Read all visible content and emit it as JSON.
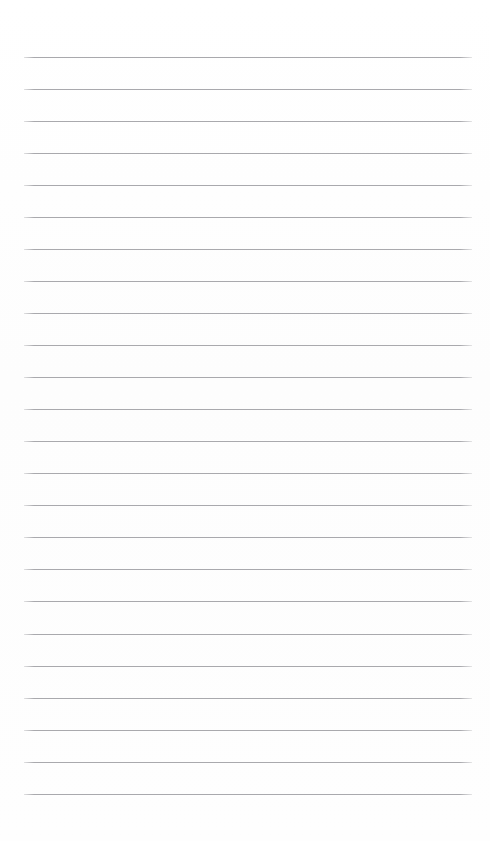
{
  "page": {
    "kind": "ruled-notepaper",
    "width": 490,
    "height": 841,
    "background_color": "#fefefe",
    "orientation": "portrait",
    "text_content": "",
    "is_blank": true
  },
  "ruling": {
    "line_count": 24,
    "line_color": "#a9a9ad",
    "line_thickness_px": 1,
    "line_spacing_px": 32,
    "first_line_y": 57,
    "last_line_y": 794,
    "line_start_x": 24,
    "line_end_x": 472,
    "line_width_px": 448,
    "left_margin_px": 24,
    "right_margin_px": 18,
    "top_margin_px": 57,
    "bottom_margin_px": 47,
    "has_vertical_margin_rule": false,
    "has_holes": false,
    "lines": [
      {
        "index": 1,
        "y": 57,
        "label": "rule-line-1"
      },
      {
        "index": 2,
        "y": 89,
        "label": "rule-line-2"
      },
      {
        "index": 3,
        "y": 121,
        "label": "rule-line-3"
      },
      {
        "index": 4,
        "y": 153,
        "label": "rule-line-4"
      },
      {
        "index": 5,
        "y": 185,
        "label": "rule-line-5"
      },
      {
        "index": 6,
        "y": 217,
        "label": "rule-line-6"
      },
      {
        "index": 7,
        "y": 249,
        "label": "rule-line-7"
      },
      {
        "index": 8,
        "y": 281,
        "label": "rule-line-8"
      },
      {
        "index": 9,
        "y": 313,
        "label": "rule-line-9"
      },
      {
        "index": 10,
        "y": 345,
        "label": "rule-line-10"
      },
      {
        "index": 11,
        "y": 377,
        "label": "rule-line-11"
      },
      {
        "index": 12,
        "y": 409,
        "label": "rule-line-12"
      },
      {
        "index": 13,
        "y": 441,
        "label": "rule-line-13"
      },
      {
        "index": 14,
        "y": 473,
        "label": "rule-line-14"
      },
      {
        "index": 15,
        "y": 505,
        "label": "rule-line-15"
      },
      {
        "index": 16,
        "y": 537,
        "label": "rule-line-16"
      },
      {
        "index": 17,
        "y": 569,
        "label": "rule-line-17"
      },
      {
        "index": 18,
        "y": 601,
        "label": "rule-line-18"
      },
      {
        "index": 19,
        "y": 634,
        "label": "rule-line-19"
      },
      {
        "index": 20,
        "y": 666,
        "label": "rule-line-20"
      },
      {
        "index": 21,
        "y": 698,
        "label": "rule-line-21"
      },
      {
        "index": 22,
        "y": 730,
        "label": "rule-line-22"
      },
      {
        "index": 23,
        "y": 762,
        "label": "rule-line-23"
      },
      {
        "index": 24,
        "y": 794,
        "label": "rule-line-24"
      }
    ]
  }
}
